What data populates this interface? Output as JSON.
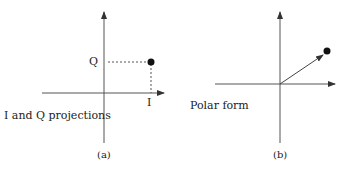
{
  "panel_a": {
    "caption": "(a)",
    "title": "I and Q projections",
    "q_label": "Q",
    "i_label": "I"
  },
  "panel_b": {
    "caption": "(b)",
    "title": "Polar form"
  },
  "colors": {
    "line": "#444444",
    "point": "#111111",
    "dash": "#555555"
  }
}
